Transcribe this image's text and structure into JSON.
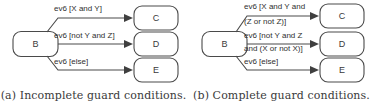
{
  "figure": {
    "panels": [
      {
        "id": "a",
        "caption": "(a) Incomplete guard conditions.",
        "source_node": {
          "label": "B"
        },
        "transitions": [
          {
            "label_lines": [
              "ev6 [X and Y]"
            ],
            "target": "C"
          },
          {
            "label_lines": [
              "ev6 [not Y and Z]"
            ],
            "target": "D"
          },
          {
            "label_lines": [
              "ev6 [else]"
            ],
            "target": "E"
          }
        ],
        "target_nodes": [
          {
            "label": "C"
          },
          {
            "label": "D"
          },
          {
            "label": "E"
          }
        ]
      },
      {
        "id": "b",
        "caption": "(b) Complete guard conditions.",
        "source_node": {
          "label": "B"
        },
        "transitions": [
          {
            "label_lines": [
              "ev6 [X and Y and",
              "(Z or not Z)]"
            ],
            "target": "C"
          },
          {
            "label_lines": [
              "ev6 [not Y and Z",
              "and (X or not X)]"
            ],
            "target": "D"
          },
          {
            "label_lines": [
              "ev6 [else]"
            ],
            "target": "E"
          }
        ],
        "target_nodes": [
          {
            "label": "C"
          },
          {
            "label": "D"
          },
          {
            "label": "E"
          }
        ]
      }
    ],
    "colors": {
      "stroke": "#4a4a4a",
      "text": "#2f2f2f",
      "background": "#ffffff",
      "caption": "#3a3a3a"
    }
  }
}
